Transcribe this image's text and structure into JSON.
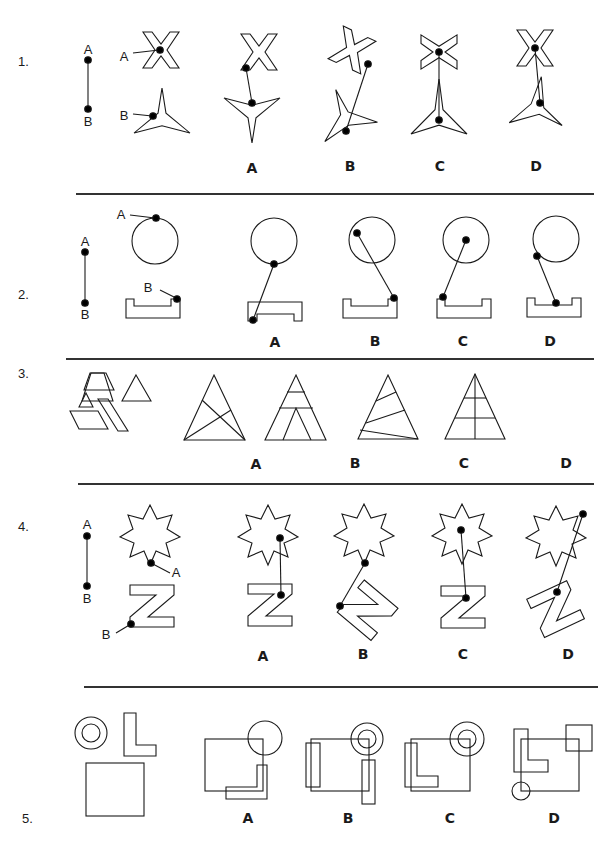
{
  "questions": [
    {
      "number": "1.",
      "options": [
        "A",
        "B",
        "C",
        "D"
      ],
      "point_labels": {
        "top": "A",
        "bottom": "B",
        "shape_a": "A",
        "shape_b": "B"
      }
    },
    {
      "number": "2.",
      "options": [
        "A",
        "B",
        "C",
        "D"
      ],
      "point_labels": {
        "top": "A",
        "bottom": "B",
        "shape_a": "A",
        "shape_b": "B"
      }
    },
    {
      "number": "3.",
      "options": [
        "A",
        "B",
        "C",
        "D"
      ]
    },
    {
      "number": "4.",
      "options": [
        "A",
        "B",
        "C",
        "D"
      ],
      "point_labels": {
        "top": "A",
        "bottom": "B",
        "shape_a": "A",
        "shape_b": "B"
      }
    },
    {
      "number": "5.",
      "options": [
        "A",
        "B",
        "C",
        "D"
      ]
    }
  ]
}
